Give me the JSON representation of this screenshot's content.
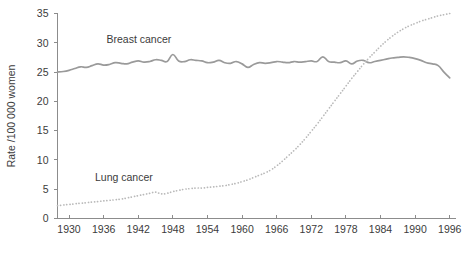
{
  "chart_data": {
    "type": "line",
    "title": "",
    "xlabel": "",
    "ylabel": "Rate /100 000 women",
    "xlim": [
      1928,
      1997
    ],
    "ylim": [
      0,
      35
    ],
    "grid": false,
    "legend_position": "inline-annotation",
    "xticks": [
      1930,
      1936,
      1942,
      1948,
      1954,
      1960,
      1966,
      1972,
      1978,
      1984,
      1990,
      1996
    ],
    "yticks": [
      0,
      5,
      10,
      15,
      20,
      25,
      30,
      35
    ],
    "xtick_labels": [
      "1930",
      "1936",
      "1942",
      "1948",
      "1954",
      "1960",
      "1966",
      "1972",
      "1978",
      "1984",
      "1990",
      "1996"
    ],
    "ytick_labels": [
      "0",
      "5",
      "10",
      "15",
      "20",
      "25",
      "30",
      "35"
    ],
    "annotations": [
      {
        "text": "Breast cancer",
        "x": 1936.5,
        "y": 30.0,
        "name": "breast-cancer-label"
      },
      {
        "text": "Lung cancer",
        "x": 1934.5,
        "y": 6.4,
        "name": "lung-cancer-label"
      }
    ],
    "series": [
      {
        "name": "Breast cancer",
        "style": "solid",
        "color": "#9a9a9a",
        "x": [
          1928,
          1929,
          1930,
          1931,
          1932,
          1933,
          1934,
          1935,
          1936,
          1937,
          1938,
          1939,
          1940,
          1941,
          1942,
          1943,
          1944,
          1945,
          1946,
          1947,
          1948,
          1949,
          1950,
          1951,
          1952,
          1953,
          1954,
          1955,
          1956,
          1957,
          1958,
          1959,
          1960,
          1961,
          1962,
          1963,
          1964,
          1965,
          1966,
          1967,
          1968,
          1969,
          1970,
          1971,
          1972,
          1973,
          1974,
          1975,
          1976,
          1977,
          1978,
          1979,
          1980,
          1981,
          1982,
          1983,
          1984,
          1985,
          1986,
          1987,
          1988,
          1989,
          1990,
          1991,
          1992,
          1993,
          1994,
          1995,
          1996
        ],
        "y": [
          25.0,
          25.1,
          25.3,
          25.6,
          25.9,
          25.8,
          26.1,
          26.4,
          26.2,
          26.3,
          26.6,
          26.5,
          26.4,
          26.7,
          26.9,
          26.7,
          26.8,
          27.1,
          27.0,
          26.8,
          28.0,
          26.9,
          26.8,
          27.1,
          27.0,
          26.9,
          26.6,
          26.7,
          27.0,
          26.6,
          26.5,
          26.8,
          26.4,
          25.8,
          26.3,
          26.6,
          26.5,
          26.6,
          26.8,
          26.7,
          26.6,
          26.8,
          26.7,
          26.8,
          26.9,
          26.8,
          27.6,
          26.8,
          26.7,
          26.6,
          26.9,
          26.4,
          26.9,
          27.0,
          26.6,
          26.8,
          27.0,
          27.2,
          27.4,
          27.5,
          27.6,
          27.5,
          27.3,
          27.0,
          26.6,
          26.4,
          26.1,
          25.0,
          24.0
        ]
      },
      {
        "name": "Lung cancer",
        "style": "dotted",
        "color": "#b9b9b9",
        "x": [
          1928,
          1929,
          1930,
          1931,
          1932,
          1933,
          1934,
          1935,
          1936,
          1937,
          1938,
          1939,
          1940,
          1941,
          1942,
          1943,
          1944,
          1945,
          1946,
          1947,
          1948,
          1949,
          1950,
          1951,
          1952,
          1953,
          1954,
          1955,
          1956,
          1957,
          1958,
          1959,
          1960,
          1961,
          1962,
          1963,
          1964,
          1965,
          1966,
          1967,
          1968,
          1969,
          1970,
          1971,
          1972,
          1973,
          1974,
          1975,
          1976,
          1977,
          1978,
          1979,
          1980,
          1981,
          1982,
          1983,
          1984,
          1985,
          1986,
          1987,
          1988,
          1989,
          1990,
          1991,
          1992,
          1993,
          1994,
          1995,
          1996
        ],
        "y": [
          2.2,
          2.3,
          2.4,
          2.5,
          2.6,
          2.7,
          2.8,
          2.9,
          3.0,
          3.1,
          3.2,
          3.3,
          3.5,
          3.7,
          3.9,
          4.1,
          4.3,
          4.5,
          4.2,
          4.3,
          4.6,
          4.8,
          5.0,
          5.1,
          5.2,
          5.2,
          5.3,
          5.4,
          5.5,
          5.6,
          5.8,
          6.0,
          6.3,
          6.6,
          7.0,
          7.4,
          7.8,
          8.3,
          9.0,
          9.8,
          10.7,
          11.6,
          12.6,
          13.7,
          14.9,
          16.1,
          17.4,
          18.7,
          20.0,
          21.3,
          22.6,
          23.9,
          25.1,
          26.3,
          27.4,
          28.4,
          29.4,
          30.3,
          31.1,
          31.8,
          32.4,
          32.9,
          33.3,
          33.7,
          34.0,
          34.3,
          34.6,
          34.8,
          35.0
        ]
      }
    ]
  }
}
